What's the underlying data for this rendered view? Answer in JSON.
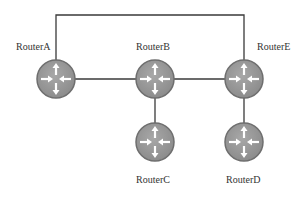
{
  "diagram": {
    "title": "",
    "colors": {
      "link": "#3a3a3a",
      "router_fill": "#9a9a9a",
      "router_rim": "#6e6e6e",
      "arrow": "#ffffff",
      "label": "#333333"
    },
    "routers": [
      {
        "id": "A",
        "label": "RouterA",
        "cx": 56,
        "cy": 79
      },
      {
        "id": "B",
        "label": "RouterB",
        "cx": 155,
        "cy": 79
      },
      {
        "id": "E",
        "label": "RouterE",
        "cx": 244,
        "cy": 79
      },
      {
        "id": "C",
        "label": "RouterC",
        "cx": 155,
        "cy": 142
      },
      {
        "id": "D",
        "label": "RouterD",
        "cx": 244,
        "cy": 142
      }
    ],
    "links": [
      {
        "from": "A",
        "to": "B"
      },
      {
        "from": "B",
        "to": "E"
      },
      {
        "from": "B",
        "to": "C"
      },
      {
        "from": "E",
        "to": "D"
      },
      {
        "from": "A",
        "to": "E",
        "route": "over-top"
      }
    ]
  }
}
